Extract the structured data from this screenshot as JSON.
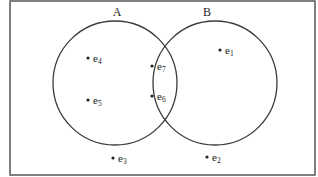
{
  "diagram": {
    "type": "venn",
    "colors": {
      "stroke": "#3a3a3a",
      "border": "#555555",
      "background": "#ffffff",
      "text": "#222222"
    },
    "universe": {
      "x": 10,
      "y": 1,
      "width": 305,
      "height": 174
    },
    "sets": [
      {
        "name": "A",
        "label": "A",
        "cx": 115,
        "cy": 83,
        "r": 62,
        "label_x": 117,
        "label_y": 16
      },
      {
        "name": "B",
        "label": "B",
        "cx": 215,
        "cy": 83,
        "r": 62,
        "label_x": 207,
        "label_y": 16
      }
    ],
    "elements": [
      {
        "id": "e1",
        "base": "e",
        "sub": "1",
        "x": 220,
        "y": 50,
        "region": "B only"
      },
      {
        "id": "e2",
        "base": "e",
        "sub": "2",
        "x": 207,
        "y": 157,
        "region": "outside"
      },
      {
        "id": "e3",
        "base": "e",
        "sub": "3",
        "x": 113,
        "y": 158,
        "region": "outside"
      },
      {
        "id": "e4",
        "base": "e",
        "sub": "4",
        "x": 88,
        "y": 58,
        "region": "A only"
      },
      {
        "id": "e5",
        "base": "e",
        "sub": "5",
        "x": 88,
        "y": 100,
        "region": "A only"
      },
      {
        "id": "e6",
        "base": "e",
        "sub": "6",
        "x": 152,
        "y": 96,
        "region": "A and B"
      },
      {
        "id": "e7",
        "base": "e",
        "sub": "7",
        "x": 152,
        "y": 66,
        "region": "A and B"
      }
    ]
  }
}
